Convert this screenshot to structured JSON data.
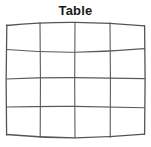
{
  "figure": {
    "title": "Table",
    "width": 151,
    "height": 147,
    "background_color": "#ffffff"
  },
  "table_graphic": {
    "name": "hand-drawn-table-grid",
    "style": "hand-drawn",
    "line_color": "#555555",
    "line_width": 1.1,
    "columns": 4,
    "rows": 4,
    "bounds": {
      "left": 6,
      "top": 23,
      "right": 145,
      "bottom": 137
    },
    "vertical_lines_x": [
      6,
      40,
      75,
      110,
      145
    ],
    "horizontal_lines_y": [
      24,
      51,
      78,
      107,
      137
    ],
    "cells": [
      [
        "",
        "",
        "",
        ""
      ],
      [
        "",
        "",
        "",
        ""
      ],
      [
        "",
        "",
        "",
        ""
      ],
      [
        "",
        "",
        "",
        ""
      ]
    ]
  }
}
